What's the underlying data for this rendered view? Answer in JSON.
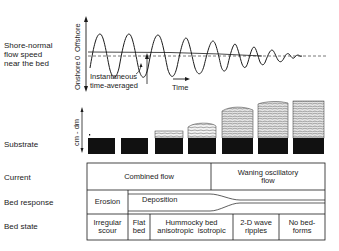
{
  "rows": {
    "flow_speed": "Shore-normal flow speed near the bed",
    "flow_speed_lines": [
      "Shore-normal",
      "flow speed",
      "near the bed"
    ],
    "substrate": "Substrate",
    "current": "Current",
    "bed_response": "Bed response",
    "bed_state": "Bed state"
  },
  "graph": {
    "y_axis_top": "Offshore",
    "y_axis_bottom": "Onshore",
    "y_axis_zero": "0",
    "legend_instantaneous": "Instantaneous",
    "legend_time_averaged": "time-averaged",
    "x_axis_label": "Time",
    "substrate_scale": "cm - dm"
  },
  "table": {
    "current": [
      "Combined flow",
      "Waning oscillatory flow"
    ],
    "current_waning_lines": [
      "Waning oscillatory",
      "flow"
    ],
    "bed_response": [
      "Erosion",
      "Deposition"
    ],
    "bed_state": [
      {
        "lines": [
          "Irregular",
          "scour"
        ]
      },
      {
        "lines": [
          "Flat",
          "bed"
        ]
      },
      {
        "lines": [
          "Hummocky bed",
          "anisotropic  isotropic"
        ]
      },
      {
        "lines": [
          "2-D wave",
          "ripples"
        ]
      },
      {
        "lines": [
          "No bed-",
          "forms"
        ]
      }
    ]
  },
  "colors": {
    "ink": "#1a1a1a",
    "background": "#ffffff",
    "substrate_fill": "#111111"
  }
}
